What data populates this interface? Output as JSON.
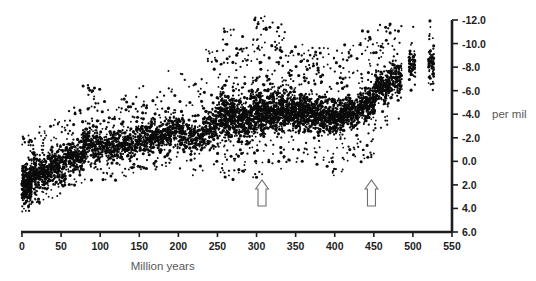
{
  "figure": {
    "name": "isotope-scatter-figure",
    "background": "#ffffff",
    "point_color": "#0b0b0b",
    "axis_color": "#1d1d1d",
    "label_color": "#58585a"
  },
  "chart_data": {
    "type": "scatter",
    "title": "",
    "subtitle": "",
    "xlabel": "Million years",
    "ylabel": "per mil",
    "unit_label": "per mil",
    "grid": false,
    "legend": null,
    "legend_position": "none",
    "xlim": [
      0,
      550
    ],
    "ylim": [
      6.0,
      -12.6
    ],
    "y_inverted": true,
    "xticks": [
      0,
      50,
      100,
      150,
      200,
      250,
      300,
      350,
      400,
      450,
      500,
      550
    ],
    "xtick_labels": [
      "0",
      "50",
      "100",
      "150",
      "200",
      "250",
      "300",
      "350",
      "400",
      "450",
      "500",
      "550"
    ],
    "yticks": [
      -12.0,
      -10.0,
      -8.0,
      -6.0,
      -4.0,
      -2.0,
      0.0,
      2.0,
      4.0,
      6.0
    ],
    "ytick_labels": [
      "-12.0",
      "-10.0",
      "-8.0",
      "-6.0",
      "-4.0",
      "-2.0",
      "0.0",
      "2.0",
      "4.0",
      "6.0"
    ],
    "x_axis_position": "bottom",
    "y_axis_position": "right",
    "annotations": [
      {
        "name": "arrow-marker-1",
        "type": "up-arrow",
        "x": 307,
        "y": 2.6,
        "label": ""
      },
      {
        "name": "arrow-marker-2",
        "type": "up-arrow",
        "x": 447,
        "y": 2.6,
        "label": ""
      }
    ],
    "point_count_approx": 4200,
    "clusters": [
      {
        "x_start": 0,
        "x_end": 12,
        "y_top": -2.2,
        "y_bottom": 4.4,
        "density": 300,
        "core_top": 0.4,
        "core_bottom": 3.6
      },
      {
        "x_start": 12,
        "x_end": 34,
        "y_top": -3.0,
        "y_bottom": 3.6,
        "density": 290,
        "core_top": -0.6,
        "core_bottom": 2.6
      },
      {
        "x_start": 34,
        "x_end": 56,
        "y_top": -3.6,
        "y_bottom": 3.2,
        "density": 250,
        "core_top": -1.2,
        "core_bottom": 2.2
      },
      {
        "x_start": 56,
        "x_end": 78,
        "y_top": -4.6,
        "y_bottom": 2.2,
        "density": 230,
        "core_top": -2.2,
        "core_bottom": 1.2
      },
      {
        "x_start": 78,
        "x_end": 100,
        "y_top": -6.6,
        "y_bottom": 1.8,
        "density": 240,
        "core_top": -3.4,
        "core_bottom": 0.6
      },
      {
        "x_start": 100,
        "x_end": 122,
        "y_top": -5.4,
        "y_bottom": 1.6,
        "density": 200,
        "core_top": -2.8,
        "core_bottom": 0.4
      },
      {
        "x_start": 122,
        "x_end": 146,
        "y_top": -5.6,
        "y_bottom": 1.4,
        "density": 210,
        "core_top": -3.0,
        "core_bottom": 0.2
      },
      {
        "x_start": 146,
        "x_end": 166,
        "y_top": -6.4,
        "y_bottom": 1.0,
        "density": 200,
        "core_top": -3.6,
        "core_bottom": -0.4
      },
      {
        "x_start": 166,
        "x_end": 186,
        "y_top": -6.0,
        "y_bottom": 0.8,
        "density": 180,
        "core_top": -3.4,
        "core_bottom": -0.6
      },
      {
        "x_start": 186,
        "x_end": 208,
        "y_top": -7.8,
        "y_bottom": 0.8,
        "density": 200,
        "core_top": -4.2,
        "core_bottom": -0.8
      },
      {
        "x_start": 208,
        "x_end": 232,
        "y_top": -7.0,
        "y_bottom": 1.4,
        "density": 190,
        "core_top": -3.8,
        "core_bottom": -0.4
      },
      {
        "x_start": 232,
        "x_end": 252,
        "y_top": -9.6,
        "y_bottom": 1.0,
        "density": 220,
        "core_top": -5.0,
        "core_bottom": -1.0
      },
      {
        "x_start": 252,
        "x_end": 272,
        "y_top": -11.4,
        "y_bottom": 1.6,
        "density": 340,
        "core_top": -6.2,
        "core_bottom": -1.6
      },
      {
        "x_start": 272,
        "x_end": 292,
        "y_top": -10.6,
        "y_bottom": 1.2,
        "density": 300,
        "core_top": -5.8,
        "core_bottom": -1.4
      },
      {
        "x_start": 292,
        "x_end": 312,
        "y_top": -12.4,
        "y_bottom": 1.4,
        "density": 360,
        "core_top": -6.6,
        "core_bottom": -1.8
      },
      {
        "x_start": 312,
        "x_end": 332,
        "y_top": -11.8,
        "y_bottom": 0.8,
        "density": 330,
        "core_top": -6.4,
        "core_bottom": -2.0
      },
      {
        "x_start": 332,
        "x_end": 352,
        "y_top": -11.0,
        "y_bottom": 0.6,
        "density": 320,
        "core_top": -6.2,
        "core_bottom": -2.2
      },
      {
        "x_start": 352,
        "x_end": 372,
        "y_top": -10.4,
        "y_bottom": 0.4,
        "density": 300,
        "core_top": -6.0,
        "core_bottom": -2.4
      },
      {
        "x_start": 372,
        "x_end": 392,
        "y_top": -9.8,
        "y_bottom": 0.6,
        "density": 280,
        "core_top": -5.6,
        "core_bottom": -2.2
      },
      {
        "x_start": 392,
        "x_end": 412,
        "y_top": -9.4,
        "y_bottom": 1.2,
        "density": 300,
        "core_top": -5.4,
        "core_bottom": -2.0
      },
      {
        "x_start": 412,
        "x_end": 432,
        "y_top": -10.0,
        "y_bottom": 0.2,
        "density": 280,
        "core_top": -5.8,
        "core_bottom": -2.6
      },
      {
        "x_start": 432,
        "x_end": 452,
        "y_top": -11.2,
        "y_bottom": 0.2,
        "density": 300,
        "core_top": -6.8,
        "core_bottom": -3.0
      },
      {
        "x_start": 452,
        "x_end": 470,
        "y_top": -11.6,
        "y_bottom": -2.6,
        "density": 220,
        "core_top": -8.2,
        "core_bottom": -4.6
      },
      {
        "x_start": 470,
        "x_end": 486,
        "y_top": -11.8,
        "y_bottom": -3.4,
        "density": 150,
        "core_top": -8.8,
        "core_bottom": -5.4
      },
      {
        "x_start": 495,
        "x_end": 503,
        "y_top": -11.6,
        "y_bottom": -5.6,
        "density": 70,
        "core_top": -9.6,
        "core_bottom": -6.6
      },
      {
        "x_start": 520,
        "x_end": 527,
        "y_top": -12.2,
        "y_bottom": -5.4,
        "density": 80,
        "core_top": -9.8,
        "core_bottom": -6.4
      }
    ]
  }
}
